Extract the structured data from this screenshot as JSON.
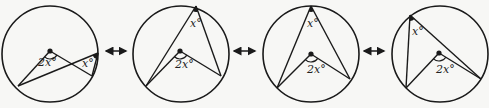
{
  "diagram": {
    "stroke_color": "#1a1a1a",
    "background": "#f7f7f5",
    "panels": [
      {
        "id": 1,
        "center": [
          50,
          54
        ],
        "radius": 48,
        "dot": [
          50,
          51
        ],
        "inscribed_vertex": [
          98,
          53
        ],
        "arc_a": [
          18,
          86
        ],
        "arc_b": [
          92,
          76
        ],
        "central_label": "2x°",
        "inscribed_label": "x°",
        "central_label_pos": [
          38,
          66
        ],
        "inscribed_label_pos": [
          82,
          67
        ]
      },
      {
        "id": 2,
        "center": [
          181,
          54
        ],
        "radius": 48,
        "dot": [
          180,
          51
        ],
        "inscribed_vertex": [
          196,
          6
        ],
        "arc_a": [
          146,
          86
        ],
        "arc_b": [
          221,
          76
        ],
        "central_label": "2x°",
        "inscribed_label": "x°",
        "central_label_pos": [
          175,
          68
        ],
        "inscribed_label_pos": [
          190,
          27
        ]
      },
      {
        "id": 3,
        "center": [
          311,
          54
        ],
        "radius": 48,
        "dot": [
          311,
          54
        ],
        "inscribed_vertex": [
          311,
          6
        ],
        "arc_a": [
          277,
          88
        ],
        "arc_b": [
          350,
          79
        ],
        "central_label": "2x°",
        "inscribed_label": "x°",
        "central_label_pos": [
          307,
          73
        ],
        "inscribed_label_pos": [
          307,
          27
        ]
      },
      {
        "id": 4,
        "center": [
          440,
          54
        ],
        "radius": 48,
        "dot": [
          439,
          53
        ],
        "inscribed_vertex": [
          410,
          15
        ],
        "arc_a": [
          406,
          88
        ],
        "arc_b": [
          481,
          79
        ],
        "central_label": "2x°",
        "inscribed_label": "x°",
        "central_label_pos": [
          436,
          73
        ],
        "inscribed_label_pos": [
          412,
          35
        ]
      }
    ],
    "connectors": [
      {
        "icon": "double-arrow-icon",
        "x1": 106,
        "x2": 126,
        "y": 51
      },
      {
        "icon": "double-arrow-icon",
        "x1": 234,
        "x2": 255,
        "y": 51
      },
      {
        "icon": "double-arrow-icon",
        "x1": 364,
        "x2": 384,
        "y": 51
      }
    ]
  }
}
